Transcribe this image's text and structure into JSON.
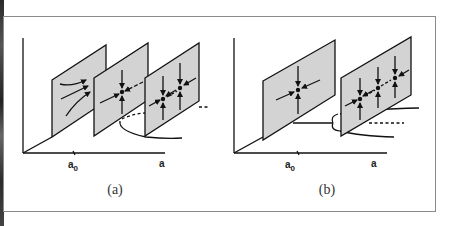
{
  "figure": {
    "panel_a": {
      "caption": "(a)",
      "x_axis_label": "a",
      "tick_label": "a",
      "tick_subscript": "0"
    },
    "panel_b": {
      "caption": "(b)",
      "x_axis_label": "a",
      "tick_label": "a",
      "tick_subscript": "0"
    },
    "colors": {
      "plane_fill": "#d3d3d3",
      "line": "#111111",
      "frame": "#8a8a8a"
    }
  }
}
